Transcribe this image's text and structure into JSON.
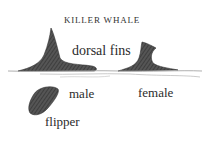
{
  "title": "KILLER WHALE",
  "labels": {
    "dorsal_fins": "dorsal fins",
    "male": "male",
    "female": "female",
    "flipper": "flipper"
  },
  "colors": {
    "ink": "#2a2a2a",
    "fin_fill": "#4a4a4a",
    "water_line": "#9a9a9a"
  }
}
